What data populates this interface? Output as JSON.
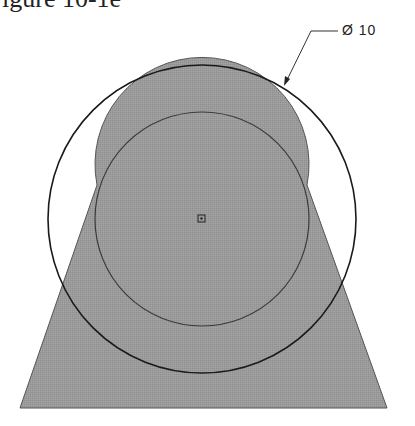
{
  "caption": {
    "text": "igure 10-1e"
  },
  "dimension": {
    "label": "Ø 10",
    "type": "diameter"
  },
  "drawing": {
    "fill_color": "#9a9a9a",
    "line_color": "#222222",
    "outer_circle": {
      "cx": 202,
      "cy": 219,
      "r": 154
    },
    "inner_circle": {
      "cx": 202,
      "cy": 219,
      "r": 107
    },
    "center_marker": {
      "x": 202,
      "y": 219
    },
    "trapezoid": {
      "bottom_left": [
        20,
        408
      ],
      "bottom_right": [
        387,
        408
      ]
    }
  }
}
